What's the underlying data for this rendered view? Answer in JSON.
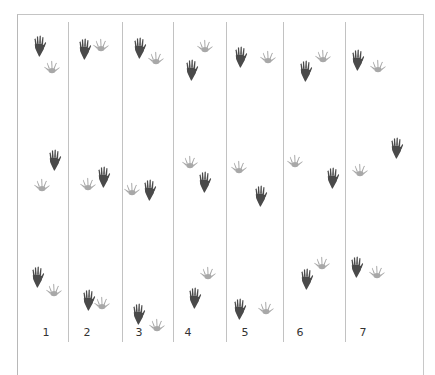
{
  "diagram": {
    "type": "footprint-tracks",
    "colors": {
      "dark_print": "#4a4a4a",
      "light_print": "#a8a8a8",
      "lines": "#c2c2c2",
      "text": "#333333"
    },
    "columns": [
      {
        "label": "1",
        "label_x": 46
      },
      {
        "label": "2",
        "label_x": 87
      },
      {
        "label": "3",
        "label_x": 139
      },
      {
        "label": "4",
        "label_x": 188
      },
      {
        "label": "5",
        "label_x": 245
      },
      {
        "label": "6",
        "label_x": 300
      },
      {
        "label": "7",
        "label_x": 363
      }
    ],
    "dividers_x": [
      68,
      122,
      173,
      226,
      283,
      345
    ],
    "prints": [
      {
        "col": 1,
        "kind": "dark",
        "x": 40,
        "y": 46
      },
      {
        "col": 1,
        "kind": "light",
        "x": 52,
        "y": 67
      },
      {
        "col": 2,
        "kind": "dark",
        "x": 85,
        "y": 49
      },
      {
        "col": 2,
        "kind": "light",
        "x": 101,
        "y": 45
      },
      {
        "col": 3,
        "kind": "dark",
        "x": 140,
        "y": 48
      },
      {
        "col": 3,
        "kind": "light",
        "x": 156,
        "y": 58
      },
      {
        "col": 4,
        "kind": "light",
        "x": 205,
        "y": 46
      },
      {
        "col": 4,
        "kind": "dark",
        "x": 192,
        "y": 70
      },
      {
        "col": 5,
        "kind": "dark",
        "x": 241,
        "y": 57
      },
      {
        "col": 5,
        "kind": "light",
        "x": 268,
        "y": 57
      },
      {
        "col": 6,
        "kind": "light",
        "x": 323,
        "y": 56
      },
      {
        "col": 6,
        "kind": "dark",
        "x": 306,
        "y": 71
      },
      {
        "col": 7,
        "kind": "dark",
        "x": 358,
        "y": 60
      },
      {
        "col": 7,
        "kind": "light",
        "x": 378,
        "y": 66
      },
      {
        "col": 1,
        "kind": "dark",
        "x": 55,
        "y": 160
      },
      {
        "col": 1,
        "kind": "light",
        "x": 42,
        "y": 185
      },
      {
        "col": 2,
        "kind": "light",
        "x": 88,
        "y": 184
      },
      {
        "col": 2,
        "kind": "dark",
        "x": 104,
        "y": 177
      },
      {
        "col": 3,
        "kind": "light",
        "x": 132,
        "y": 189
      },
      {
        "col": 3,
        "kind": "dark",
        "x": 150,
        "y": 190
      },
      {
        "col": 4,
        "kind": "light",
        "x": 190,
        "y": 162
      },
      {
        "col": 4,
        "kind": "dark",
        "x": 205,
        "y": 182
      },
      {
        "col": 5,
        "kind": "light",
        "x": 239,
        "y": 167
      },
      {
        "col": 5,
        "kind": "dark",
        "x": 261,
        "y": 196
      },
      {
        "col": 6,
        "kind": "light",
        "x": 295,
        "y": 161
      },
      {
        "col": 6,
        "kind": "dark",
        "x": 333,
        "y": 178
      },
      {
        "col": 7,
        "kind": "light",
        "x": 360,
        "y": 170
      },
      {
        "col": 7,
        "kind": "dark",
        "x": 397,
        "y": 148
      },
      {
        "col": 1,
        "kind": "dark",
        "x": 38,
        "y": 277
      },
      {
        "col": 1,
        "kind": "light",
        "x": 54,
        "y": 290
      },
      {
        "col": 2,
        "kind": "dark",
        "x": 89,
        "y": 300
      },
      {
        "col": 2,
        "kind": "light",
        "x": 102,
        "y": 303
      },
      {
        "col": 3,
        "kind": "dark",
        "x": 139,
        "y": 314
      },
      {
        "col": 3,
        "kind": "light",
        "x": 157,
        "y": 325
      },
      {
        "col": 4,
        "kind": "light",
        "x": 208,
        "y": 273
      },
      {
        "col": 4,
        "kind": "dark",
        "x": 195,
        "y": 298
      },
      {
        "col": 5,
        "kind": "dark",
        "x": 240,
        "y": 309
      },
      {
        "col": 5,
        "kind": "light",
        "x": 266,
        "y": 308
      },
      {
        "col": 6,
        "kind": "dark",
        "x": 307,
        "y": 279
      },
      {
        "col": 6,
        "kind": "light",
        "x": 322,
        "y": 263
      },
      {
        "col": 7,
        "kind": "dark",
        "x": 357,
        "y": 267
      },
      {
        "col": 7,
        "kind": "light",
        "x": 377,
        "y": 272
      }
    ]
  }
}
